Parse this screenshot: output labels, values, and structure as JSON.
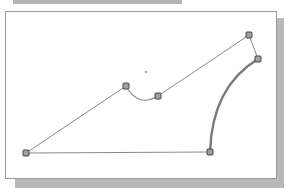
{
  "colors": {
    "background": "#ffffff",
    "panel_border": "#9a9a9a",
    "shadow": "#b8b8b8",
    "top_bar": "#b4b4b4",
    "edge": "#8a8a8a",
    "thick_arc": "#7a7a7a",
    "node_fill": "#a0a0a0",
    "node_stroke": "#444444",
    "center_mark": "#666666"
  },
  "diagram": {
    "nodes": [
      {
        "id": "A",
        "x": 26,
        "y": 153
      },
      {
        "id": "B",
        "x": 126,
        "y": 86
      },
      {
        "id": "C",
        "x": 158,
        "y": 96
      },
      {
        "id": "D",
        "x": 249,
        "y": 35
      },
      {
        "id": "E",
        "x": 258,
        "y": 59
      },
      {
        "id": "F",
        "x": 210,
        "y": 152
      }
    ],
    "edges": [
      {
        "from": "A",
        "to": "B",
        "type": "line"
      },
      {
        "from": "B",
        "to": "C",
        "type": "arc-thin"
      },
      {
        "from": "C",
        "to": "D",
        "type": "line"
      },
      {
        "from": "D",
        "to": "E",
        "type": "line"
      },
      {
        "from": "E",
        "to": "F",
        "type": "arc-thick"
      },
      {
        "from": "F",
        "to": "A",
        "type": "line"
      }
    ],
    "center_mark": {
      "x": 146,
      "y": 72
    }
  }
}
